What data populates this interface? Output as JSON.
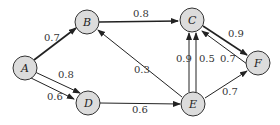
{
  "nodes": [
    {
      "id": "A",
      "label": "A",
      "x": 25,
      "y": 68
    },
    {
      "id": "B",
      "label": "B",
      "x": 87,
      "y": 22
    },
    {
      "id": "C",
      "label": "C",
      "x": 192,
      "y": 20
    },
    {
      "id": "D",
      "label": "D",
      "x": 88,
      "y": 103
    },
    {
      "id": "E",
      "label": "E",
      "x": 193,
      "y": 104
    },
    {
      "id": "F",
      "label": "F",
      "x": 258,
      "y": 63
    }
  ],
  "edges": [
    {
      "from": "A",
      "to": "B",
      "weight": "0.7",
      "thick": true
    },
    {
      "from": "A",
      "to": "D",
      "weight": "0.8",
      "thick": false
    },
    {
      "from": "A",
      "to": "D",
      "weight": "0.6",
      "thick": false
    },
    {
      "from": "B",
      "to": "C",
      "weight": "0.8",
      "thick": true
    },
    {
      "from": "C",
      "to": "F",
      "weight": "0.9",
      "thick": true
    },
    {
      "from": "F",
      "to": "C",
      "weight": "0.7",
      "thick": false
    },
    {
      "from": "E",
      "to": "C",
      "weight": "0.9",
      "thick": false
    },
    {
      "from": "E",
      "to": "C",
      "weight": "0.5",
      "thick": false
    },
    {
      "from": "E",
      "to": "B",
      "weight": "0.3",
      "thick": false
    },
    {
      "from": "D",
      "to": "E",
      "weight": "0.6",
      "thick": false
    },
    {
      "from": "E",
      "to": "F",
      "weight": "0.7",
      "thick": false
    }
  ]
}
